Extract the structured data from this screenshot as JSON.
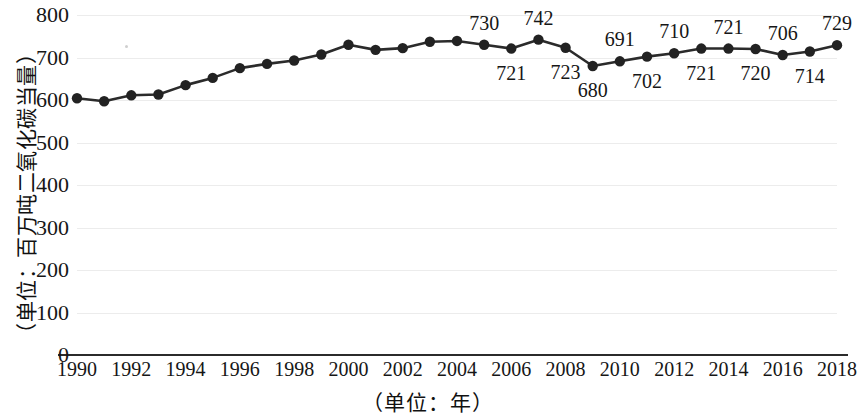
{
  "chart_data": {
    "type": "line",
    "title": "",
    "xlabel": "（单位：年）",
    "ylabel": "（单位：百万吨二氧化碳当量）",
    "x": [
      1990,
      1991,
      1992,
      1993,
      1994,
      1995,
      1996,
      1997,
      1998,
      1999,
      2000,
      2001,
      2002,
      2003,
      2004,
      2005,
      2006,
      2007,
      2008,
      2009,
      2010,
      2011,
      2012,
      2013,
      2014,
      2015,
      2016,
      2017,
      2018
    ],
    "values": [
      604,
      597,
      611,
      613,
      635,
      652,
      675,
      685,
      693,
      707,
      730,
      718,
      722,
      737,
      739,
      730,
      721,
      742,
      723,
      680,
      691,
      702,
      710,
      721,
      721,
      720,
      706,
      714,
      729
    ],
    "point_labels": [
      null,
      null,
      null,
      null,
      null,
      null,
      null,
      null,
      null,
      null,
      null,
      null,
      null,
      null,
      null,
      "730",
      "721",
      "742",
      "723",
      "680",
      "691",
      "702",
      "710",
      "721",
      "721",
      "720",
      "706",
      "714",
      "729"
    ],
    "label_side": [
      null,
      null,
      null,
      null,
      null,
      null,
      null,
      null,
      null,
      null,
      null,
      null,
      null,
      null,
      null,
      "above",
      "below",
      "above",
      "below",
      "below",
      "above",
      "below",
      "above",
      "below",
      "above",
      "below",
      "above",
      "below",
      "above"
    ],
    "xticks": [
      "1990",
      "1992",
      "1994",
      "1996",
      "1998",
      "2000",
      "2002",
      "2004",
      "2006",
      "2008",
      "2010",
      "2012",
      "2014",
      "2016",
      "2018"
    ],
    "yticks": [
      "800",
      "700",
      "600",
      "500",
      "400",
      "300",
      "200",
      "100",
      "0"
    ],
    "ylim": [
      0,
      800
    ],
    "xlim": [
      1990,
      2018
    ],
    "grid": true,
    "legend": "none",
    "line_color": "#2b2b2b",
    "marker_color": "#222222",
    "grid_color": "#ececec",
    "axis_color": "#2b2b2b"
  }
}
